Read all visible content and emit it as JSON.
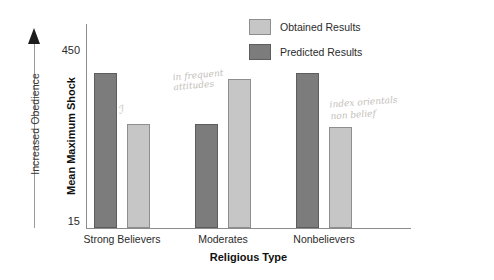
{
  "chart_data": {
    "type": "bar",
    "title": "",
    "categories": [
      "Strong Believers",
      "Moderates",
      "Nonbelievers"
    ],
    "series": [
      {
        "name": "Obtained Results",
        "color": "#c6c6c6",
        "values": [
          270,
          380,
          262
        ]
      },
      {
        "name": "Predicted Results",
        "color": "#7c7c7c",
        "values": [
          395,
          268,
          395
        ]
      }
    ],
    "xlabel": "Religious Type",
    "ylabel": "Mean Maximum Shock",
    "ylim": [
      15,
      450
    ],
    "ytick_labels": [
      "450",
      "15"
    ],
    "grid": false,
    "legend_position": "top-right",
    "annotations": [
      "Increased Obedience"
    ]
  },
  "axes": {
    "y_title": "Mean Maximum Shock",
    "y_tick_top": "450",
    "y_tick_bottom": "15",
    "x_title": "Religious Type",
    "obedience_label": "Increased Obedience"
  },
  "legend": {
    "items": [
      {
        "label": "Obtained Results",
        "swatch": "obtained-swatch"
      },
      {
        "label": "Predicted Results",
        "swatch": "predicted-swatch"
      }
    ]
  },
  "categories": [
    {
      "label": "Strong Believers"
    },
    {
      "label": "Moderates"
    },
    {
      "label": "Nonbelievers"
    }
  ],
  "handwritten_notes": {
    "left": "ℐ",
    "center": "in frequent\nattitudes",
    "right": "index orientals\nnon belief"
  },
  "colors": {
    "obtained": "#c6c6c6",
    "predicted": "#7c7c7c",
    "axis": "#8c8c8c",
    "text": "#2b2b2b",
    "handwriting": "#b9b4ae"
  }
}
